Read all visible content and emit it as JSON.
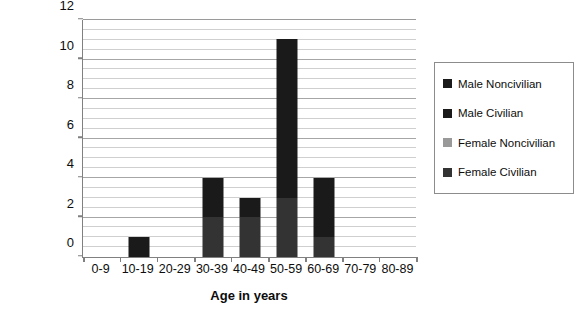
{
  "chart_data": {
    "type": "bar",
    "barmode": "stacked",
    "title": "",
    "xlabel": "Age in years",
    "ylabel": "Number of cases",
    "categories": [
      "0-9",
      "10-19",
      "20-29",
      "30-39",
      "40-49",
      "50-59",
      "60-69",
      "70-79",
      "80-89"
    ],
    "ylim": [
      0,
      12
    ],
    "ytick_labels": [
      "0",
      "2",
      "4",
      "6",
      "8",
      "10",
      "12"
    ],
    "ytick_values": [
      0,
      2,
      4,
      6,
      8,
      10,
      12
    ],
    "minor_gridline_step": 0.5,
    "grid": true,
    "grid_axis": "y",
    "legend_position": "right",
    "series": [
      {
        "name": "Female Civilian",
        "color": "#333333",
        "values": [
          0,
          0,
          0,
          2,
          2,
          3,
          1,
          0,
          0
        ]
      },
      {
        "name": "Female Noncivilian",
        "color": "#999999",
        "values": [
          0,
          0,
          0,
          0,
          0,
          0,
          0,
          0,
          0
        ]
      },
      {
        "name": "Male Civilian",
        "color": "#1a1a1a",
        "values": [
          0,
          1,
          0,
          2,
          1,
          8,
          3,
          0,
          0
        ]
      },
      {
        "name": "Male Noncivilian",
        "color": "#1a1a1a",
        "values": [
          0,
          0,
          0,
          0,
          0,
          0,
          0,
          0,
          0
        ]
      }
    ],
    "totals": [
      0,
      1,
      0,
      4,
      3,
      11,
      4,
      0,
      0
    ]
  },
  "legend": {
    "entries": [
      {
        "label": "Male Noncivilian",
        "color": "#1a1a1a"
      },
      {
        "label": "Male Civilian",
        "color": "#1a1a1a"
      },
      {
        "label": "Female Noncivilian",
        "color": "#999999"
      },
      {
        "label": "Female Civilian",
        "color": "#333333"
      }
    ]
  },
  "colors": {
    "axis": "#808080",
    "gridline_major": "#a6a6a6",
    "gridline_minor": "#cfcfcf",
    "text": "#0d0d0d",
    "background": "#ffffff"
  }
}
